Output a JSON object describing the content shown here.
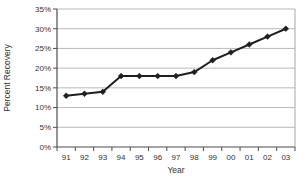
{
  "chart_data": {
    "type": "line",
    "title": "",
    "xlabel": "Year",
    "ylabel": "Percent Recovery",
    "categories": [
      "91",
      "92",
      "93",
      "94",
      "95",
      "96",
      "97",
      "98",
      "99",
      "00",
      "01",
      "02",
      "03"
    ],
    "series": [
      {
        "name": "Percent Recovery",
        "marker": "diamond",
        "values": [
          13,
          13.5,
          14,
          18,
          18,
          18,
          18,
          19,
          22,
          24,
          26,
          28,
          30
        ]
      }
    ],
    "ylim": [
      0,
      35
    ],
    "ytick_step": 5,
    "ytick_labels": [
      "0%",
      "5%",
      "10%",
      "15%",
      "20%",
      "25%",
      "30%",
      "35%"
    ],
    "grid": true,
    "legend": false,
    "colors": {
      "series": "#1f1f1f",
      "gridline": "#b9b9b9",
      "plot_border": "#a8a8a8",
      "axis": "#4d4d4d",
      "text": "#333333",
      "background": "#ffffff"
    }
  }
}
